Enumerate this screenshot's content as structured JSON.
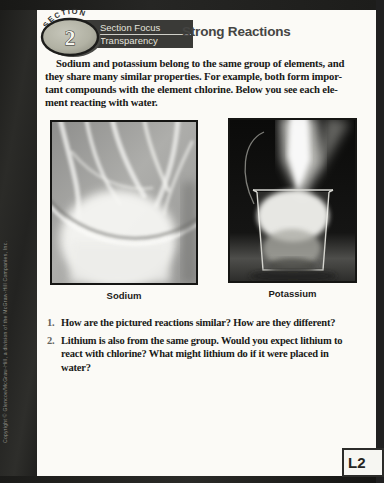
{
  "frame": {
    "copyright_vertical": "Copyright © Glencoe/McGraw-Hill, a division of the McGraw-Hill Companies, Inc."
  },
  "header": {
    "section_word": "SECTION",
    "section_number": "2",
    "label_line1": "Section Focus",
    "label_line2": "Transparency",
    "title": "Strong Reactions"
  },
  "intro": {
    "lines": [
      "Sodium and potassium belong to the same group of elements, and",
      "they share many similar properties. For example, both form impor-",
      "tant compounds with the element chlorine. Below you see each ele-",
      "ment reacting with water."
    ]
  },
  "figures": [
    {
      "caption": "Sodium"
    },
    {
      "caption": "Potassium"
    }
  ],
  "questions": [
    {
      "number": "1.",
      "lines": [
        "How are the pictured reactions similar? How are they different?"
      ]
    },
    {
      "number": "2.",
      "lines": [
        "Lithium is also from the same group. Would you expect lithium to",
        "react with chlorine? What might lithium do if it were placed in",
        "water?"
      ]
    }
  ],
  "level_badge": "L2",
  "colors": {
    "frame": "#242422",
    "page": "#fbfaf6",
    "label_box_bg": "#3a3a37",
    "label_text": "#e4e4dd",
    "title_text": "#454543",
    "body_text": "#191917",
    "question_number": "#63635c",
    "badge_oval_fill": "#b2b2a4"
  }
}
